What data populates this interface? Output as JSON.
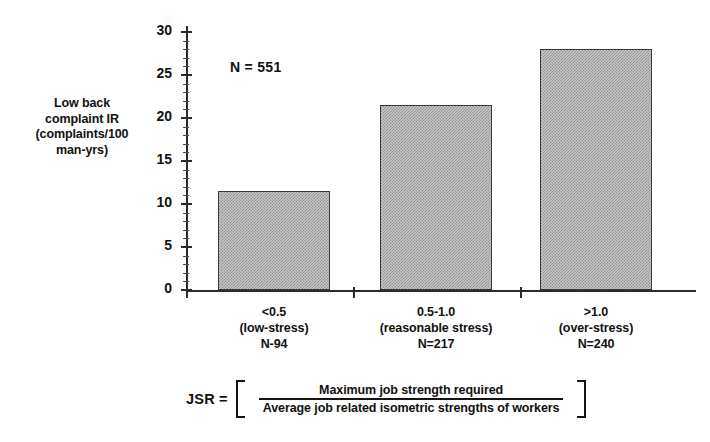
{
  "chart_data": {
    "type": "bar",
    "title": "",
    "xlabel": "",
    "ylabel": "Low back complaint IR (complaints/100 man-yrs)",
    "ylim": [
      0,
      30
    ],
    "ytick_values": [
      0,
      5,
      10,
      15,
      20,
      25,
      30
    ],
    "ytick_labels": [
      "0",
      "5",
      "10",
      "15",
      "20",
      "25",
      "30"
    ],
    "grid": false,
    "legend": "none",
    "categories": [
      "<0.5 (low-stress) N-94",
      "0.5-1.0 (reasonable stress) N=217",
      ">1.0 (over-stress) N=240"
    ],
    "values": [
      11.5,
      21.5,
      28.0
    ],
    "annotations": [
      "N = 551"
    ],
    "bar_fill": "#c9c9c9",
    "bar_edge": "#3a3a3a"
  },
  "y_axis": {
    "label_lines": [
      "Low back",
      "complaint IR",
      "(complaints/100",
      "man-yrs)"
    ],
    "ticks": [
      {
        "value": 30,
        "label": "30"
      },
      {
        "value": 25,
        "label": "25"
      },
      {
        "value": 20,
        "label": "20"
      },
      {
        "value": 15,
        "label": "15"
      },
      {
        "value": 10,
        "label": "10"
      },
      {
        "value": 5,
        "label": "5"
      },
      {
        "value": 0,
        "label": "0"
      }
    ]
  },
  "x_axis": {
    "categories": [
      {
        "value_label": "<0.5",
        "descriptor": "(low-stress)",
        "count": "N-94"
      },
      {
        "value_label": "0.5-1.0",
        "descriptor": "(reasonable stress)",
        "count": "N=217"
      },
      {
        "value_label": ">1.0",
        "descriptor": "(over-stress)",
        "count": "N=240"
      }
    ]
  },
  "bars": [
    {
      "category": "<0.5",
      "value": 11.5
    },
    {
      "category": "0.5-1.0",
      "value": 21.5
    },
    {
      "category": ">1.0",
      "value": 28.0
    }
  ],
  "annotation": {
    "sample_size": "N = 551"
  },
  "formula": {
    "lhs": "JSR =",
    "numerator": "Maximum job strength required",
    "denominator": "Average job related isometric strengths of workers"
  }
}
